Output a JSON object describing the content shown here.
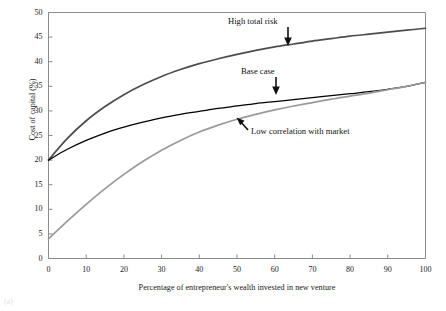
{
  "figure": {
    "caption_stub": "(a)"
  },
  "axes": {
    "y_title": "Cost of capital (%)",
    "x_title": "Percentage of entrepreneur's wealth invested in new venture",
    "y_ticks": [
      "0",
      "5",
      "10",
      "15",
      "20",
      "25",
      "30",
      "35",
      "40",
      "45",
      "50"
    ],
    "x_ticks": [
      "0",
      "10",
      "20",
      "30",
      "40",
      "50",
      "60",
      "70",
      "80",
      "90",
      "100"
    ]
  },
  "annotations": [
    {
      "id": "high-total-risk",
      "label": "High total risk",
      "arrow": "down",
      "x_px": 228,
      "y_px": 16
    },
    {
      "id": "base-case",
      "label": "Base case",
      "arrow": "down",
      "x_px": 241,
      "y_px": 66
    },
    {
      "id": "low-correlation",
      "label": "Low correlation with market",
      "arrow": "up-left",
      "x_px": 251,
      "y_px": 126
    }
  ],
  "colors": {
    "high_total_risk": "#4d4d4d",
    "base_case": "#000000",
    "low_correlation": "#9a9a9a",
    "frame": "#8c8c8c",
    "text": "#1a1a1a"
  },
  "chart_data": {
    "type": "line",
    "title": "",
    "xlabel": "Percentage of entrepreneur's wealth invested in new venture",
    "ylabel": "Cost of capital (%)",
    "xlim": [
      0,
      100
    ],
    "ylim": [
      0,
      50
    ],
    "xticks": [
      0,
      10,
      20,
      30,
      40,
      50,
      60,
      70,
      80,
      90,
      100
    ],
    "yticks": [
      0,
      5,
      10,
      15,
      20,
      25,
      30,
      35,
      40,
      45,
      50
    ],
    "grid": false,
    "legend": "annotations-inline",
    "x": [
      0,
      5,
      10,
      15,
      20,
      25,
      30,
      35,
      40,
      45,
      50,
      55,
      60,
      65,
      70,
      75,
      80,
      85,
      90,
      95,
      100
    ],
    "series": [
      {
        "name": "High total risk",
        "color": "#4d4d4d",
        "values": [
          20.0,
          24.4,
          28.0,
          30.9,
          33.3,
          35.3,
          37.0,
          38.4,
          39.6,
          40.6,
          41.5,
          42.3,
          43.0,
          43.6,
          44.2,
          44.7,
          45.2,
          45.6,
          46.0,
          46.4,
          46.8
        ]
      },
      {
        "name": "Base case",
        "color": "#000000",
        "values": [
          20.0,
          22.2,
          24.0,
          25.5,
          26.7,
          27.7,
          28.6,
          29.3,
          29.9,
          30.5,
          31.0,
          31.5,
          31.9,
          32.3,
          32.7,
          33.1,
          33.5,
          33.9,
          34.4,
          35.0,
          35.8
        ]
      },
      {
        "name": "Low correlation with market",
        "color": "#9a9a9a",
        "values": [
          4.0,
          7.6,
          11.0,
          14.2,
          17.1,
          19.7,
          22.0,
          24.0,
          25.7,
          27.1,
          28.3,
          29.3,
          30.2,
          31.0,
          31.7,
          32.4,
          33.0,
          33.6,
          34.3,
          35.0,
          35.8
        ]
      }
    ]
  }
}
